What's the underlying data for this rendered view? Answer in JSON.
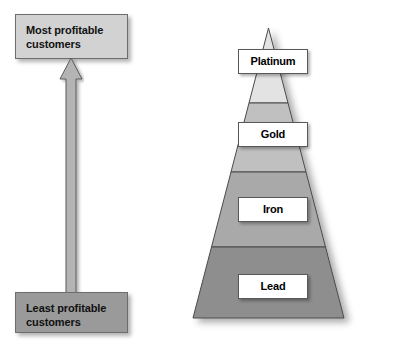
{
  "diagram": {
    "left_axis": {
      "top_box": {
        "line1": "Most profitable",
        "line2": "customers",
        "fill": "#d2d2d2"
      },
      "bottom_box": {
        "line1": "Least profitable",
        "line2": "customers",
        "fill": "#9a9a9a"
      },
      "arrow": {
        "direction": "up",
        "fill": "#b4b4b4",
        "stroke": "#5a5a5a"
      }
    },
    "pyramid": {
      "outline_color": "#4a4a4a",
      "tiers": [
        {
          "label": "Platinum",
          "fill": "#e3e3e3",
          "rank": 1
        },
        {
          "label": "Gold",
          "fill": "#c0c0c0",
          "rank": 2
        },
        {
          "label": "Iron",
          "fill": "#a9a9a9",
          "rank": 3
        },
        {
          "label": "Lead",
          "fill": "#8e8e8e",
          "rank": 4
        }
      ]
    }
  }
}
